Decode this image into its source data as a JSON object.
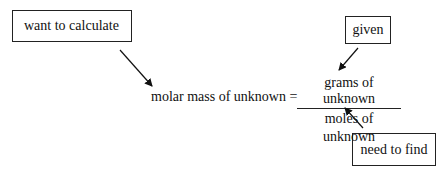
{
  "labels": {
    "want_to_calculate": "want to calculate",
    "given": "given",
    "need_to_find": "need to find"
  },
  "equation": {
    "lhs": "molar mass of unknown =",
    "numerator": "grams of unknown",
    "denominator": "moles of unknown"
  },
  "arrows": [
    {
      "from": "want_to_calculate",
      "to": "equation.lhs"
    },
    {
      "from": "given",
      "to": "equation.numerator"
    },
    {
      "from": "need_to_find",
      "to": "equation.denominator"
    }
  ]
}
